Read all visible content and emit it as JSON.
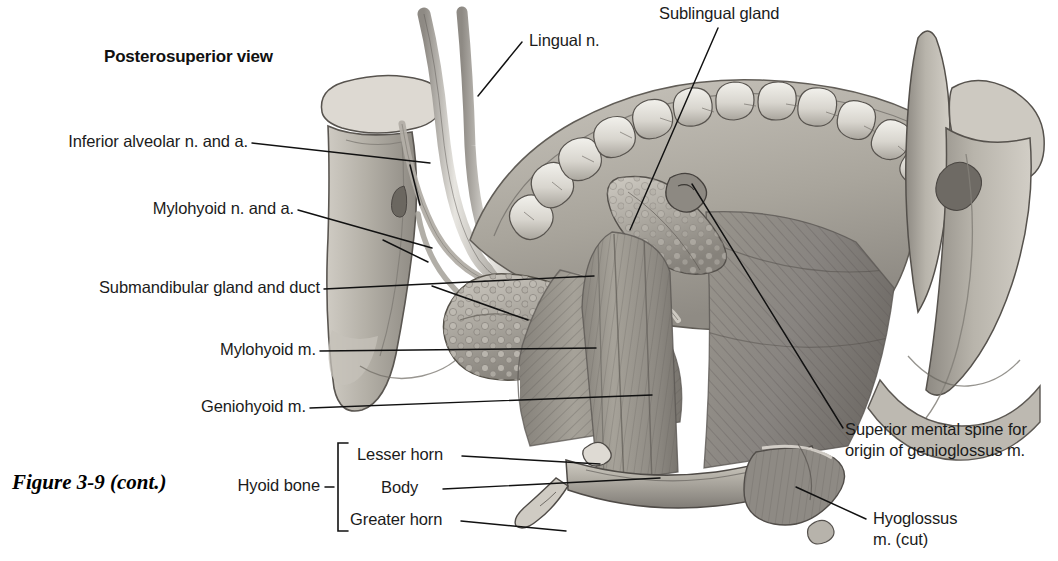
{
  "figure": {
    "caption": "Figure 3-9 (cont.)",
    "view_heading": "Posterosuperior view",
    "style": "grayscale anatomical illustration"
  },
  "labels": {
    "lingual_nerve": "Lingual n.",
    "sublingual_gland": "Sublingual gland",
    "inferior_alveolar": "Inferior alveolar n. and a.",
    "mylohyoid_nerve": "Mylohyoid n. and a.",
    "submandibular": "Submandibular gland and duct",
    "mylohyoid_muscle": "Mylohyoid m.",
    "geniohyoid_muscle": "Geniohyoid m.",
    "superior_mental_spine_line1": "Superior mental spine for",
    "superior_mental_spine_line2": "origin of genioglossus m.",
    "hyoglossus_line1": "Hyoglossus",
    "hyoglossus_line2": "m. (cut)",
    "hyoid_bone": "Hyoid bone",
    "lesser_horn": "Lesser horn",
    "body": "Body",
    "greater_horn": "Greater horn"
  },
  "colors": {
    "text": "#1b1b1b",
    "leader_line": "#111111",
    "background": "#ffffff",
    "bone_light": "#d9d6cf",
    "bone_mid": "#b5b1a8",
    "bone_shadow": "#8b8780",
    "muscle_mid": "#9b978f",
    "muscle_dark": "#706c65",
    "gland_light": "#c2beb6",
    "tooth_white": "#ececE6",
    "outline": "#4a4641"
  }
}
